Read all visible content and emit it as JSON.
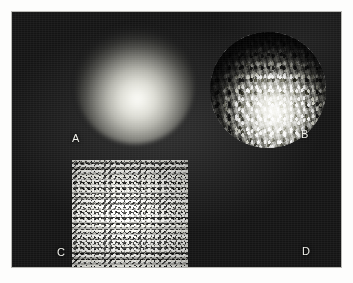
{
  "figure": {
    "caption_labels": {
      "a": "A",
      "b": "B",
      "c": "C",
      "d": "D"
    },
    "panels": [
      {
        "id": "a",
        "label": "A",
        "kind": "sphere-smooth-shaded",
        "description": "Smooth Phong-shaded sphere with no surface perturbation"
      },
      {
        "id": "b",
        "label": "B",
        "kind": "sphere-bump-mapped",
        "description": "Sphere rendered with bump-mapped speckle relief"
      },
      {
        "id": "c",
        "label": "C",
        "kind": "texture-swatch",
        "description": "Square random speckle bump / displacement texture map"
      },
      {
        "id": "d",
        "label": "D",
        "kind": "sphere-bump-mapped",
        "description": "Second bump-mapped sphere variant"
      }
    ],
    "colors": {
      "plate_background": "#141414",
      "page_background": "#fdfdfc",
      "label_text": "#f0f0ea",
      "highlight": "#fafaf6",
      "texture_dark": "#1a1a1a"
    }
  }
}
